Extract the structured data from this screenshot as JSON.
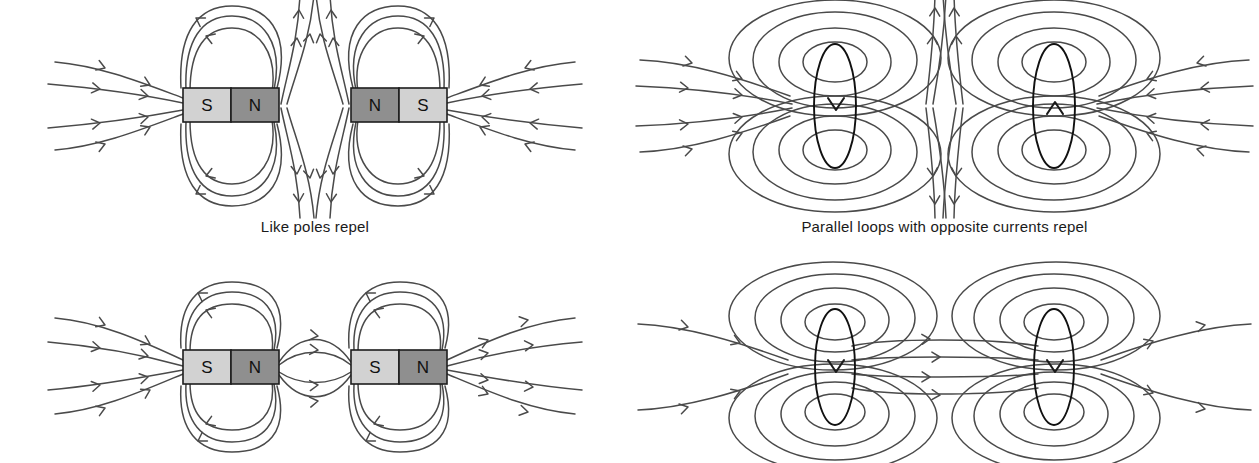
{
  "figure": {
    "background_color": "#ffffff",
    "line_color": "#4a4a4a",
    "coil_color": "#111111"
  },
  "panels": [
    {
      "id": "top-left",
      "kind": "bar-magnets",
      "caption": "Like poles repel",
      "interaction": "repel",
      "magnets": [
        {
          "id": "left-magnet",
          "poles": [
            "S",
            "N"
          ],
          "order": "S-N"
        },
        {
          "id": "right-magnet",
          "poles": [
            "N",
            "S"
          ],
          "order": "N-S"
        }
      ]
    },
    {
      "id": "top-right",
      "kind": "current-loops",
      "caption": "Parallel loops with opposite currents repel",
      "interaction": "repel",
      "loops": [
        {
          "id": "left-loop",
          "current_direction": "down"
        },
        {
          "id": "right-loop",
          "current_direction": "up"
        }
      ]
    },
    {
      "id": "bottom-left",
      "kind": "bar-magnets",
      "caption": "",
      "interaction": "attract",
      "magnets": [
        {
          "id": "left-magnet",
          "poles": [
            "S",
            "N"
          ],
          "order": "S-N"
        },
        {
          "id": "right-magnet",
          "poles": [
            "S",
            "N"
          ],
          "order": "S-N"
        }
      ]
    },
    {
      "id": "bottom-right",
      "kind": "current-loops",
      "caption": "",
      "interaction": "attract",
      "loops": [
        {
          "id": "left-loop",
          "current_direction": "down"
        },
        {
          "id": "right-loop",
          "current_direction": "down"
        }
      ]
    }
  ],
  "magnet_style": {
    "south_label": "S",
    "south_fill": "#d2d2d2",
    "north_label": "N",
    "north_fill": "#8f8f8f",
    "border_color": "#1d1d1d"
  },
  "labels": {
    "pole_south": "S",
    "pole_north": "N"
  },
  "captions": {
    "like_poles_repel": "Like poles repel",
    "parallel_loops_opposite_currents_repel": "Parallel loops with opposite currents repel"
  }
}
